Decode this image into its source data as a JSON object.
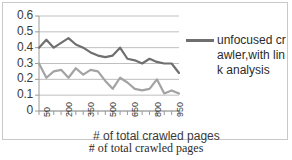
{
  "chart_data": {
    "type": "line",
    "title": "",
    "xlabel": "# of total crawled pages",
    "ylabel": "",
    "ylim": [
      0,
      0.6
    ],
    "ytick_labels": [
      "0.6",
      "0.5",
      "0.4",
      "0.3",
      "0.2",
      "0.1",
      "0"
    ],
    "yticks": [
      0.6,
      0.5,
      0.4,
      0.3,
      0.2,
      0.1,
      0
    ],
    "xtick_labels": [
      "50",
      "200",
      "350",
      "500",
      "650",
      "800",
      "950"
    ],
    "xticks": [
      50,
      200,
      350,
      500,
      650,
      800,
      950
    ],
    "x": [
      50,
      100,
      150,
      200,
      250,
      300,
      350,
      400,
      450,
      500,
      550,
      600,
      650,
      700,
      750,
      800,
      850,
      900,
      950,
      1000
    ],
    "grid": true,
    "legend_position": "right",
    "series": [
      {
        "name": "unfocused crawler,with link analysis",
        "color": "#6f6f6f",
        "values": [
          0.4,
          0.45,
          0.4,
          0.43,
          0.46,
          0.42,
          0.4,
          0.37,
          0.35,
          0.34,
          0.35,
          0.4,
          0.33,
          0.32,
          0.3,
          0.33,
          0.31,
          0.3,
          0.3,
          0.24
        ]
      },
      {
        "name": "series-2",
        "color": "#a3a3a3",
        "values": [
          0.3,
          0.21,
          0.25,
          0.26,
          0.21,
          0.27,
          0.23,
          0.26,
          0.25,
          0.19,
          0.14,
          0.21,
          0.18,
          0.14,
          0.13,
          0.14,
          0.2,
          0.11,
          0.13,
          0.11
        ]
      }
    ]
  },
  "legend": {
    "label": "unfocused crawler,with link analysis"
  },
  "axis": {
    "inner_title": "# of total crawled pages"
  },
  "caption": {
    "text": "# of total crawled pages"
  }
}
